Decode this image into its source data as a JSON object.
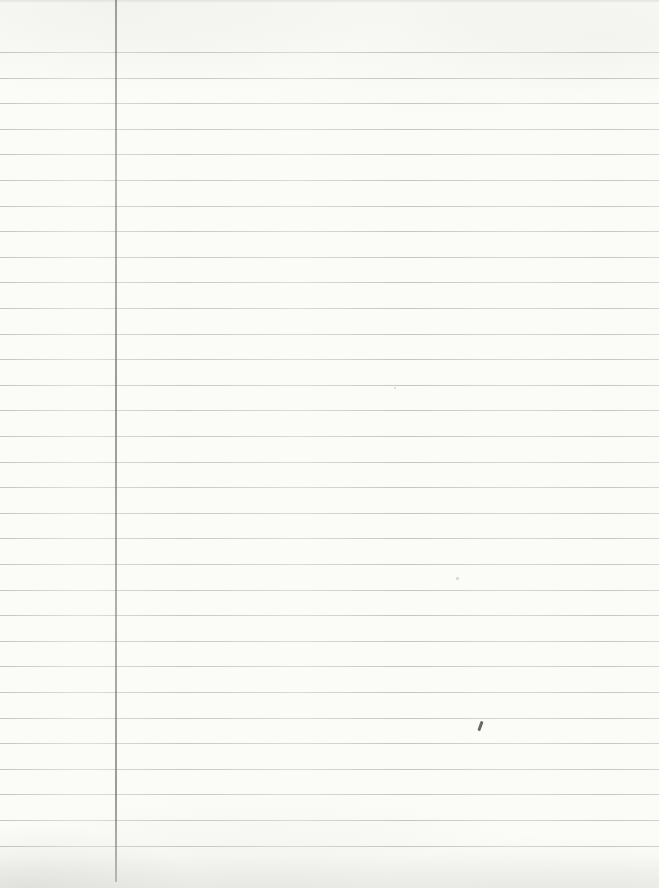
{
  "document": {
    "kind": "blank-ruled-notebook-paper-scan",
    "paper_color": "#fbfbf8",
    "width_px": 659,
    "height_px": 888
  },
  "ruling": {
    "horizontal_line_color": "#8f8f8c",
    "line_thickness_px": 1,
    "line_y_positions": [
      52,
      78,
      103,
      129,
      154,
      180,
      206,
      231,
      257,
      282,
      308,
      334,
      359,
      385,
      410,
      436,
      462,
      487,
      513,
      538,
      564,
      590,
      615,
      641,
      666,
      692,
      718,
      743,
      769,
      794,
      820,
      846
    ]
  },
  "margin_line": {
    "color": "#6e7377",
    "x_px": 115,
    "top_px": 0,
    "bottom_px": 882,
    "thickness_px": 1.5
  },
  "marks": [
    {
      "name": "pencil-tick-mark",
      "x_px": 479,
      "y_px": 721,
      "width_px": 2.5,
      "height_px": 10,
      "rotation_deg": 20,
      "color": "#4f4c4a",
      "opacity": 0.85
    },
    {
      "name": "faint-speck",
      "x_px": 456,
      "y_px": 577,
      "width_px": 3,
      "height_px": 3,
      "rotation_deg": 0,
      "color": "#bdbdb8",
      "opacity": 0.55
    },
    {
      "name": "faint-speck",
      "x_px": 394,
      "y_px": 387,
      "width_px": 2,
      "height_px": 2,
      "rotation_deg": 0,
      "color": "#b5b5b0",
      "opacity": 0.5
    }
  ],
  "shading": {
    "bottom_shadow_color": "#bebeb8",
    "top_edge_color": "#aaaaa5"
  }
}
